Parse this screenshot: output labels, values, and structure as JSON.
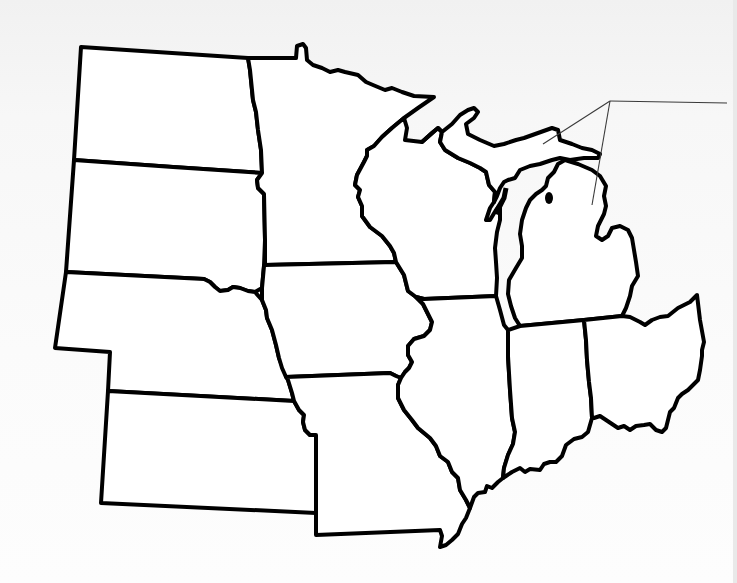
{
  "map": {
    "title": "",
    "region": "Midwest United States (blank outline)",
    "style": {
      "background": "#f6f6f6",
      "state_fill": "#ffffff",
      "border_color": "#000000",
      "leader_line_color": "#3a3a3a"
    },
    "states": [
      {
        "id": "north-dakota",
        "label": ""
      },
      {
        "id": "south-dakota",
        "label": ""
      },
      {
        "id": "nebraska",
        "label": ""
      },
      {
        "id": "kansas",
        "label": ""
      },
      {
        "id": "minnesota",
        "label": ""
      },
      {
        "id": "iowa",
        "label": ""
      },
      {
        "id": "missouri",
        "label": ""
      },
      {
        "id": "wisconsin",
        "label": ""
      },
      {
        "id": "illinois",
        "label": ""
      },
      {
        "id": "michigan-upper",
        "label": ""
      },
      {
        "id": "michigan-lower",
        "label": ""
      },
      {
        "id": "indiana",
        "label": ""
      },
      {
        "id": "ohio",
        "label": ""
      }
    ],
    "callout": {
      "label": "",
      "targets": [
        "michigan-upper",
        "michigan-lower"
      ]
    }
  }
}
